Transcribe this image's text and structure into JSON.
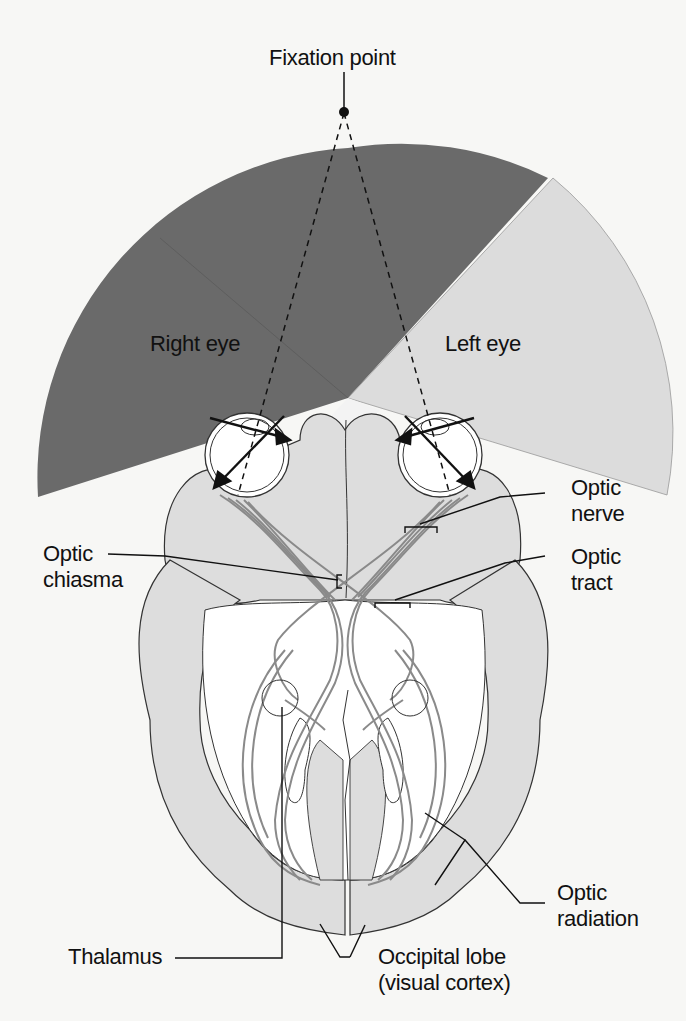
{
  "diagram": {
    "colors": {
      "background": "#f7f7f5",
      "shared_field": "#6a6a6a",
      "left_eye_field": "#dcdcdc",
      "brain_fill": "#dddddd",
      "fiber": "#8a8a8a",
      "outline": "#222222"
    },
    "labels": {
      "fixation_point": "Fixation point",
      "right_eye": "Right eye",
      "left_eye": "Left eye",
      "optic_nerve": [
        "Optic",
        "nerve"
      ],
      "optic_chiasma": [
        "Optic",
        "chiasma"
      ],
      "optic_tract": [
        "Optic",
        "tract"
      ],
      "optic_radiation": [
        "Optic",
        "radiation"
      ],
      "thalamus": "Thalamus",
      "occipital_lobe": [
        "Occipital lobe",
        "(visual cortex)"
      ]
    }
  }
}
